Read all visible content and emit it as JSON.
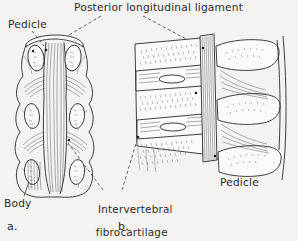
{
  "figure": {
    "title": "Posterior longitudinal ligament",
    "background_color": "#f4f3f1",
    "ink_color": "#2e2e2e",
    "panels": [
      {
        "key": "a",
        "caption": "a.",
        "view": "posterior view of vertebral column showing posterior longitudinal ligament",
        "labels": [
          "Pedicle",
          "Body",
          "Intervertebral fibrocartilage",
          "Posterior longitudinal ligament"
        ]
      },
      {
        "key": "b",
        "caption": "b.",
        "view": "sagittal section of vertebral column showing posterior longitudinal ligament and discs",
        "labels": [
          "Pedicle",
          "Intervertebral fibrocartilage",
          "Posterior longitudinal ligament"
        ]
      }
    ],
    "labels": {
      "title": "Posterior longitudinal ligament",
      "pedicle_left": "Pedicle",
      "pedicle_right": "Pedicle",
      "body": "Body",
      "fibrocartilage_line1": "Intervertebral",
      "fibrocartilage_line2": "fibrocartilage",
      "caption_a": "a.",
      "caption_b": "b."
    }
  }
}
